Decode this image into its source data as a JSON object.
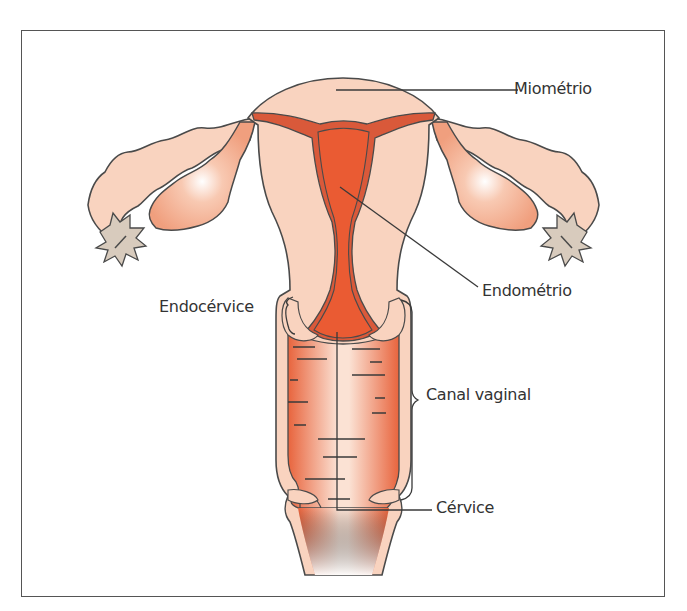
{
  "diagram": {
    "title": "",
    "colors": {
      "tissue": "#f9d3bf",
      "endometrium_dark": "#d9593a",
      "cavity": "#ea5b33",
      "ovary": "#f3a587",
      "fimbriae": "#d8cbbd",
      "outline": "#4a4a4a"
    },
    "labels": {
      "miometrio": "Miométrio",
      "endometrio": "Endométrio",
      "endocervice": "Endocérvice",
      "canal_vaginal": "Canal vaginal",
      "cervice": "Cérvice"
    }
  }
}
